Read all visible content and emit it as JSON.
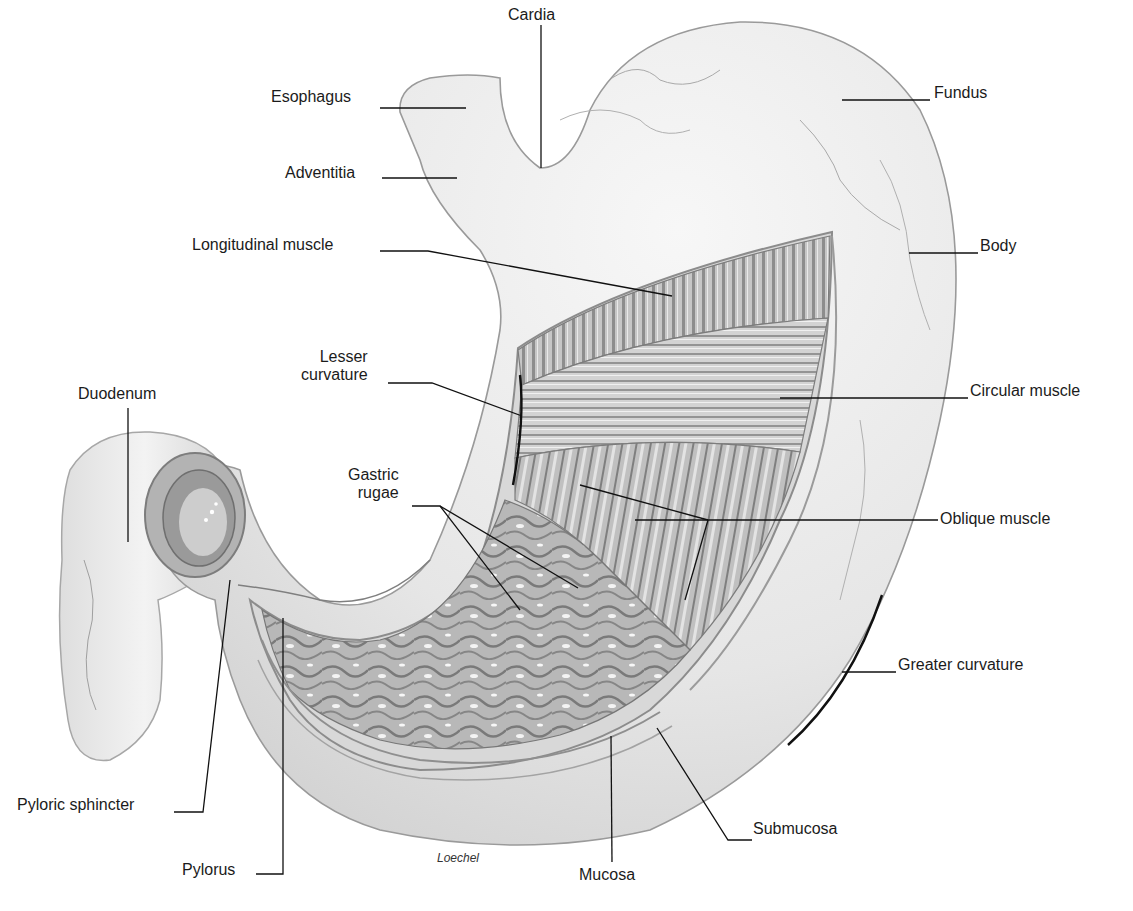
{
  "figure": {
    "signature": "Loechel",
    "colors": {
      "background": "#ffffff",
      "tissue_light": "#ececec",
      "tissue_mid": "#c9c9c9",
      "tissue_dark": "#8a8a8a",
      "line": "#111111"
    }
  },
  "labels": [
    {
      "id": "cardia",
      "text": "Cardia",
      "x": 508,
      "y": 6,
      "align": "left",
      "leader": [
        [
          541,
          25
        ],
        [
          541,
          168
        ]
      ]
    },
    {
      "id": "esophagus",
      "text": "Esophagus",
      "x": 271,
      "y": 88,
      "align": "left",
      "leader": [
        [
          380,
          108
        ],
        [
          466,
          108
        ]
      ]
    },
    {
      "id": "adventitia",
      "text": "Adventitia",
      "x": 285,
      "y": 164,
      "align": "left",
      "leader": [
        [
          382,
          178
        ],
        [
          457,
          178
        ]
      ]
    },
    {
      "id": "fundus",
      "text": "Fundus",
      "x": 934,
      "y": 84,
      "align": "left",
      "leader": [
        [
          842,
          100
        ],
        [
          930,
          100
        ]
      ]
    },
    {
      "id": "body",
      "text": "Body",
      "x": 980,
      "y": 237,
      "align": "left",
      "leader": [
        [
          909,
          253
        ],
        [
          978,
          253
        ]
      ]
    },
    {
      "id": "longitudinal-muscle",
      "text": "Longitudinal muscle",
      "x": 192,
      "y": 236,
      "align": "left",
      "leader": [
        [
          380,
          251
        ],
        [
          428,
          251
        ],
        [
          672,
          296
        ]
      ]
    },
    {
      "id": "lesser-curvature",
      "text": [
        "Lesser",
        "curvature"
      ],
      "x": 301,
      "y": 348,
      "align": "right",
      "leader": [
        [
          388,
          383
        ],
        [
          432,
          383
        ],
        [
          522,
          416
        ]
      ]
    },
    {
      "id": "circular-muscle",
      "text": "Circular muscle",
      "x": 970,
      "y": 382,
      "align": "left",
      "leader": [
        [
          780,
          398
        ],
        [
          968,
          398
        ]
      ]
    },
    {
      "id": "duodenum",
      "text": "Duodenum",
      "x": 78,
      "y": 385,
      "align": "left",
      "leader": [
        [
          128,
          408
        ],
        [
          128,
          542
        ]
      ]
    },
    {
      "id": "gastric-rugae",
      "text": [
        "Gastric",
        "rugae"
      ],
      "x": 348,
      "y": 466,
      "align": "right",
      "leader": [
        [
          412,
          506
        ],
        [
          440,
          506
        ],
        [
          520,
          610
        ]
      ],
      "leader2": [
        [
          440,
          506
        ],
        [
          578,
          588
        ]
      ]
    },
    {
      "id": "oblique-muscle",
      "text": "Oblique muscle",
      "x": 940,
      "y": 510,
      "align": "left",
      "leader": [
        [
          580,
          485
        ],
        [
          708,
          520
        ],
        [
          938,
          520
        ]
      ],
      "leader2": [
        [
          635,
          520
        ],
        [
          708,
          520
        ]
      ],
      "leader3": [
        [
          708,
          520
        ],
        [
          685,
          600
        ]
      ]
    },
    {
      "id": "greater-curvature",
      "text": "Greater curvature",
      "x": 898,
      "y": 656,
      "align": "left",
      "leader": [
        [
          842,
          672
        ],
        [
          896,
          672
        ]
      ]
    },
    {
      "id": "pyloric-sphincter",
      "text": "Pyloric sphincter",
      "x": 17,
      "y": 796,
      "align": "left",
      "leader": [
        [
          174,
          812
        ],
        [
          203,
          812
        ],
        [
          230,
          580
        ]
      ]
    },
    {
      "id": "pylorus",
      "text": "Pylorus",
      "x": 182,
      "y": 861,
      "align": "left",
      "leader": [
        [
          256,
          874
        ],
        [
          283,
          874
        ],
        [
          283,
          618
        ]
      ]
    },
    {
      "id": "mucosa",
      "text": "Mucosa",
      "x": 579,
      "y": 866,
      "align": "left",
      "leader": [
        [
          612,
          862
        ],
        [
          611,
          736
        ]
      ]
    },
    {
      "id": "submucosa",
      "text": "Submucosa",
      "x": 753,
      "y": 820,
      "align": "left",
      "leader": [
        [
          752,
          840
        ],
        [
          728,
          840
        ],
        [
          657,
          728
        ]
      ]
    }
  ],
  "curvature_marks": {
    "lesser": {
      "d": "M520 375 Q 525 420 513 485"
    },
    "greater": {
      "d": "M882 595 Q 850 690 788 745"
    }
  }
}
